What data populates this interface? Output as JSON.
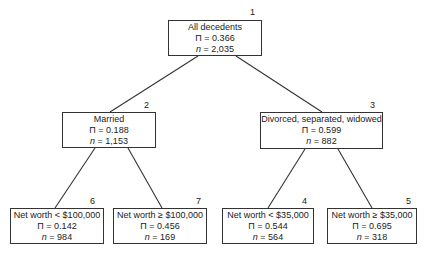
{
  "tree": {
    "nodes": [
      {
        "id": "1",
        "label": "All decedents",
        "pi": "Π = 0.366",
        "n_label": "n",
        "n": " = 2,035"
      },
      {
        "id": "2",
        "label": "Married",
        "pi": "Π = 0.188",
        "n_label": "n",
        "n": " = 1,153"
      },
      {
        "id": "3",
        "label": "Divorced, separated, widowed",
        "pi": "Π = 0.599",
        "n_label": "n",
        "n": " = 882"
      },
      {
        "id": "6",
        "label": "Net worth < $100,000",
        "pi": "Π = 0.142",
        "n_label": "n",
        "n": " = 984"
      },
      {
        "id": "7",
        "label": "Net worth ≥ $100,000",
        "pi": "Π = 0.456",
        "n_label": "n",
        "n": " = 169"
      },
      {
        "id": "4",
        "label": "Net worth < $35,000",
        "pi": "Π = 0.544",
        "n_label": "n",
        "n": " = 564"
      },
      {
        "id": "5",
        "label": "Net worth ≥ $35,000",
        "pi": "Π = 0.695",
        "n_label": "n",
        "n": " = 318"
      }
    ],
    "edges": [
      {
        "from": "1",
        "to": "2"
      },
      {
        "from": "1",
        "to": "3"
      },
      {
        "from": "2",
        "to": "6"
      },
      {
        "from": "2",
        "to": "7"
      },
      {
        "from": "3",
        "to": "4"
      },
      {
        "from": "3",
        "to": "5"
      }
    ]
  }
}
